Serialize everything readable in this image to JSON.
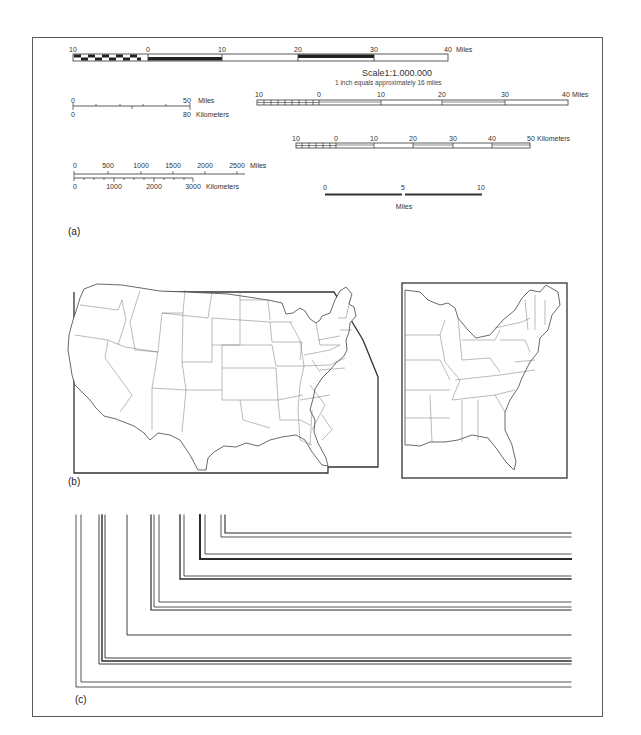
{
  "figure": {
    "panels": {
      "a": {
        "label": "(a)"
      },
      "b": {
        "label": "(b)"
      },
      "c": {
        "label": "(c)"
      }
    }
  },
  "scale_bars": {
    "bar1": {
      "ticks": [
        "10",
        "0",
        "10",
        "20",
        "30",
        "40"
      ],
      "unit": "Miles",
      "style": "alternating filled/hollow segments, subdivided extension left of 0"
    },
    "scale_statement": {
      "title": "Scale1:1.000.000",
      "subtitle": "1 inch equals approximately 16 miles"
    },
    "bar2": {
      "top_ticks": [
        "0",
        "50"
      ],
      "top_unit": "Miles",
      "bottom_ticks": [
        "0",
        "80"
      ],
      "bottom_unit": "Kilometers",
      "style": "single line, tick marks both sides"
    },
    "bar3": {
      "ticks": [
        "10",
        "0",
        "10",
        "20",
        "30",
        "40"
      ],
      "unit": "Miles",
      "style": "double-line hollow segments"
    },
    "bar4": {
      "ticks": [
        "10",
        "0",
        "10",
        "20",
        "30",
        "40",
        "50"
      ],
      "unit": "Kilometers",
      "style": "double-line hollow segments"
    },
    "bar5": {
      "top_ticks": [
        "0",
        "500",
        "1000",
        "1500",
        "2000",
        "2500"
      ],
      "top_unit": "Miles",
      "bottom_ticks": [
        "0",
        "1000",
        "2000",
        "3000"
      ],
      "bottom_unit": "Kilometers",
      "style": "dual-unit line scale"
    },
    "bar6": {
      "ticks": [
        "0",
        "5",
        "10"
      ],
      "unit": "Miles",
      "style": "heavy line bar"
    }
  },
  "maps": {
    "conterminous_us": {
      "description": "United States outline map with state boundaries inside a clipped neatline"
    },
    "eastern_us": {
      "description": "Eastern United States outline map with state boundaries inside a rectangular neatline"
    }
  },
  "line_frames": {
    "description": "Nested L-shaped frame corners with varying line weights and double-line combinations",
    "count": 8
  }
}
